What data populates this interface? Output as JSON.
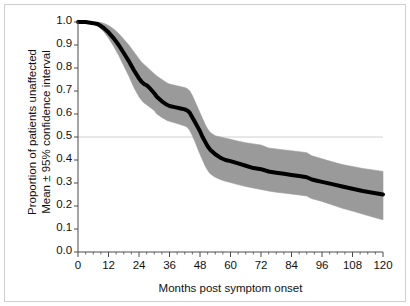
{
  "chart_data": {
    "type": "line",
    "title": "",
    "xlabel": "Months post symptom onset",
    "ylabel_line1": "Proportion of patients unaffected",
    "ylabel_line2": "Mean ± 95% confidence interval",
    "xlim": [
      0,
      120
    ],
    "ylim": [
      0.0,
      1.0
    ],
    "xticks": [
      0,
      12,
      24,
      36,
      48,
      60,
      72,
      84,
      96,
      108,
      120
    ],
    "xtick_labels": [
      "0",
      "12",
      "24",
      "36",
      "48",
      "60",
      "72",
      "84",
      "96",
      "108",
      "120"
    ],
    "yticks": [
      0.0,
      0.1,
      0.2,
      0.3,
      0.4,
      0.5,
      0.6,
      0.7,
      0.8,
      0.9,
      1.0
    ],
    "ytick_labels": [
      "0.0",
      "0.1",
      "0.2",
      "0.3",
      "0.4",
      "0.5",
      "0.6",
      "0.7",
      "0.8",
      "0.9",
      "1.0"
    ],
    "xminor_step": 3,
    "grid": "horizontal-single",
    "gridline_y": 0.5,
    "gridline_color": "#d0d0d0",
    "legend": "none",
    "series": [
      {
        "name": "Mean proportion unaffected",
        "color": "#000000",
        "x": [
          0,
          3,
          6,
          8,
          10,
          12,
          14,
          16,
          18,
          20,
          21,
          22,
          24,
          25,
          26,
          27,
          28,
          30,
          31,
          33,
          35,
          36,
          38,
          40,
          42,
          43,
          44,
          45,
          46,
          47,
          48,
          49,
          50,
          51,
          52,
          54,
          56,
          58,
          60,
          63,
          66,
          69,
          72,
          75,
          78,
          81,
          84,
          87,
          90,
          92,
          94,
          96,
          100,
          104,
          108,
          112,
          116,
          120
        ],
        "values": [
          1.0,
          1.0,
          0.995,
          0.99,
          0.975,
          0.955,
          0.93,
          0.9,
          0.865,
          0.83,
          0.81,
          0.79,
          0.755,
          0.74,
          0.73,
          0.725,
          0.715,
          0.69,
          0.675,
          0.655,
          0.64,
          0.635,
          0.63,
          0.625,
          0.62,
          0.615,
          0.605,
          0.585,
          0.565,
          0.545,
          0.525,
          0.5,
          0.48,
          0.46,
          0.445,
          0.425,
          0.41,
          0.4,
          0.395,
          0.385,
          0.375,
          0.365,
          0.36,
          0.35,
          0.345,
          0.34,
          0.335,
          0.33,
          0.325,
          0.315,
          0.31,
          0.305,
          0.295,
          0.285,
          0.275,
          0.265,
          0.258,
          0.25
        ]
      },
      {
        "name": "Upper 95% confidence limit",
        "color": "#9a9a9a",
        "x": [
          0,
          3,
          6,
          8,
          10,
          12,
          14,
          16,
          18,
          20,
          21,
          22,
          24,
          25,
          26,
          27,
          28,
          30,
          31,
          33,
          35,
          36,
          38,
          40,
          42,
          43,
          44,
          45,
          46,
          47,
          48,
          49,
          50,
          51,
          52,
          54,
          56,
          58,
          60,
          63,
          66,
          69,
          72,
          75,
          78,
          81,
          84,
          87,
          90,
          92,
          94,
          96,
          100,
          104,
          108,
          112,
          116,
          120
        ],
        "values": [
          1.0,
          1.0,
          1.0,
          1.0,
          0.995,
          0.985,
          0.97,
          0.95,
          0.925,
          0.9,
          0.885,
          0.87,
          0.84,
          0.825,
          0.815,
          0.805,
          0.795,
          0.775,
          0.765,
          0.75,
          0.735,
          0.73,
          0.725,
          0.72,
          0.715,
          0.71,
          0.7,
          0.68,
          0.655,
          0.63,
          0.605,
          0.58,
          0.555,
          0.535,
          0.52,
          0.505,
          0.5,
          0.495,
          0.49,
          0.482,
          0.475,
          0.47,
          0.465,
          0.452,
          0.448,
          0.444,
          0.44,
          0.436,
          0.432,
          0.418,
          0.412,
          0.405,
          0.392,
          0.38,
          0.372,
          0.363,
          0.357,
          0.35
        ]
      },
      {
        "name": "Lower 95% confidence limit",
        "color": "#9a9a9a",
        "x": [
          0,
          3,
          6,
          8,
          10,
          12,
          14,
          16,
          18,
          20,
          21,
          22,
          24,
          25,
          26,
          27,
          28,
          30,
          31,
          33,
          35,
          36,
          38,
          40,
          42,
          43,
          44,
          45,
          46,
          47,
          48,
          49,
          50,
          51,
          52,
          54,
          56,
          58,
          60,
          63,
          66,
          69,
          72,
          75,
          78,
          81,
          84,
          87,
          90,
          92,
          94,
          96,
          100,
          104,
          108,
          112,
          116,
          120
        ],
        "values": [
          1.0,
          0.998,
          0.99,
          0.98,
          0.96,
          0.93,
          0.895,
          0.855,
          0.81,
          0.765,
          0.74,
          0.715,
          0.675,
          0.66,
          0.648,
          0.64,
          0.632,
          0.615,
          0.6,
          0.585,
          0.572,
          0.568,
          0.562,
          0.555,
          0.548,
          0.542,
          0.528,
          0.505,
          0.48,
          0.452,
          0.425,
          0.4,
          0.375,
          0.355,
          0.34,
          0.325,
          0.315,
          0.308,
          0.302,
          0.293,
          0.285,
          0.278,
          0.272,
          0.265,
          0.26,
          0.256,
          0.252,
          0.248,
          0.244,
          0.232,
          0.226,
          0.22,
          0.205,
          0.19,
          0.178,
          0.165,
          0.152,
          0.14
        ]
      }
    ],
    "band_fill_color": "#9a9a9a",
    "mean_line_width_px": 4,
    "axis_color": "#4a4a4a",
    "frame_color": "#cfcfcf",
    "background": "#ffffff"
  }
}
